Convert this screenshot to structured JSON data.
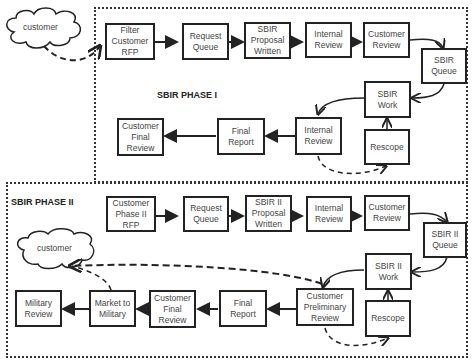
{
  "phase1": {
    "label": "SBIR PHASE I",
    "cloud": "customer",
    "boxes": {
      "filter_rfp": "Filter\nCustomer\nRFP",
      "request_queue": "Request\nQueue",
      "proposal_written": "SBIR\nProposal\nWritten",
      "internal_review_top": "Internal\nReview",
      "customer_review": "Customer\nReview",
      "sbir_queue": "SBIR\nQueue",
      "sbir_work": "SBIR\nWork",
      "internal_review_bottom": "Internal\nReview",
      "rescope": "Rescope",
      "final_report": "Final\nReport",
      "customer_final_review": "Customer\nFinal\nReview"
    }
  },
  "phase2": {
    "label": "SBIR PHASE II",
    "cloud": "customer",
    "boxes": {
      "phase2_rfp": "Customer\nPhase II\nRFP",
      "request_queue": "Request\nQueue",
      "proposal_written": "SBIR  II\nProposal\nWritten",
      "internal_review": "Internal\nReview",
      "customer_review": "Customer\nReview",
      "sbir2_queue": "SBIR II\nQueue",
      "sbir2_work": "SBIR II\nWork",
      "customer_preliminary_review": "Customer\nPreliminary\nReview",
      "rescope": "Rescope",
      "final_report": "Final\nReport",
      "customer_final_review": "Customer\nFinal\nReview",
      "market_to_military": "Market to\nMilitary",
      "military_review": "Military\nReview"
    }
  },
  "colors": {
    "line": "#222222",
    "region_border": "#333333",
    "text": "#444444"
  }
}
